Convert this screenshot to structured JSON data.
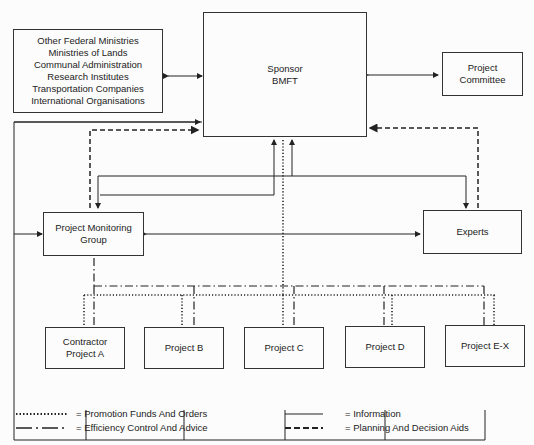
{
  "nodes": {
    "sponsor": {
      "lines": [
        "Sponsor",
        "BMFT"
      ]
    },
    "stakeholders": {
      "lines": [
        "Other Federal Ministries",
        "Ministries of Lands",
        "Communal Administration",
        "Research Institutes",
        "Transportation Companies",
        "International Organisations"
      ]
    },
    "committee": {
      "lines": [
        "Project",
        "Committee"
      ]
    },
    "monitoring": {
      "lines": [
        "Project Monitoring",
        "Group"
      ]
    },
    "experts": {
      "lines": [
        "Experts"
      ]
    },
    "project_a": {
      "lines": [
        "Contractor",
        "Project A"
      ]
    },
    "project_b": {
      "lines": [
        "Project B"
      ]
    },
    "project_c": {
      "lines": [
        "Project C"
      ]
    },
    "project_d": {
      "lines": [
        "Project D"
      ]
    },
    "project_ex": {
      "lines": [
        "Project E-X"
      ]
    }
  },
  "legend": [
    {
      "style": "dotted",
      "label": "= Promotion Funds And Orders"
    },
    {
      "style": "dash-dot",
      "label": "= Efficiency Control And Advice"
    },
    {
      "style": "solid",
      "label": "= Information"
    },
    {
      "style": "dashed",
      "label": "= Planning And Decision Aids"
    }
  ]
}
